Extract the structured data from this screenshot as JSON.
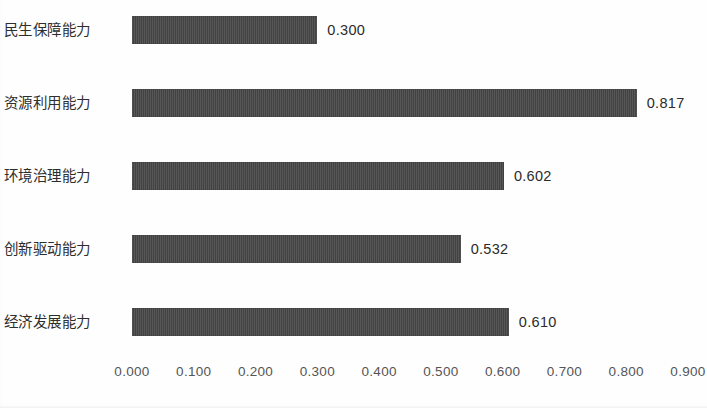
{
  "chart_data": {
    "type": "bar",
    "orientation": "horizontal",
    "title": "",
    "subtitle": "",
    "xlabel": "",
    "ylabel": "",
    "categories": [
      "民生保障能力",
      "资源利用能力",
      "环境治理能力",
      "创新驱动能力",
      "经济发展能力"
    ],
    "values": [
      0.3,
      0.817,
      0.602,
      0.532,
      0.61
    ],
    "value_labels": [
      "0.300",
      "0.817",
      "0.602",
      "0.532",
      "0.610"
    ],
    "series": [
      {
        "name": "",
        "values": [
          0.3,
          0.817,
          0.602,
          0.532,
          0.61
        ]
      }
    ],
    "xlim": [
      0.0,
      0.9
    ],
    "xticks": [
      0.0,
      0.1,
      0.2,
      0.3,
      0.4,
      0.5,
      0.6,
      0.7,
      0.8,
      0.9
    ],
    "xtick_labels": [
      "0.000",
      "0.100",
      "0.200",
      "0.300",
      "0.400",
      "0.500",
      "0.600",
      "0.700",
      "0.800",
      "0.900"
    ],
    "grid": false,
    "legend": null,
    "legend_position": "none",
    "bar_color": "#464646",
    "background_color": "#ffffff",
    "text_color": "#2e2e2e",
    "axis_label_color": "#555555",
    "data_labels_shown": true,
    "data_label_position": "outside-end",
    "annotations": []
  }
}
